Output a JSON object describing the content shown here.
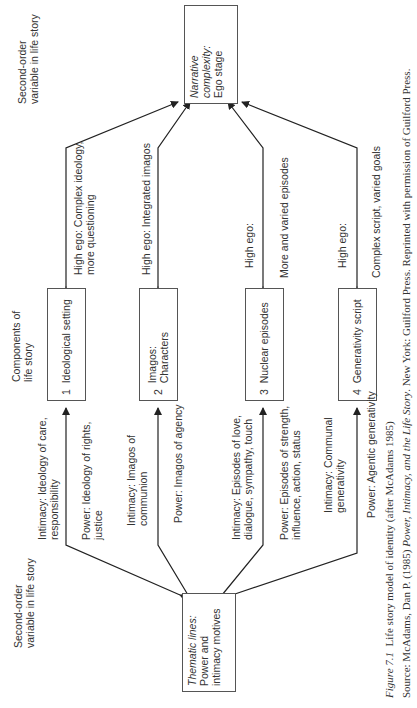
{
  "figure": {
    "caption_label": "Figure 7.1",
    "caption_text": "Life story model of identity (after McAdams 1985)",
    "source_prefix": "Source: McAdams, Dan P. (1985) ",
    "source_title": "Power, Intimacy, and the Life Story",
    "source_suffix": ". New York: Guilford Press. Reprinted with permission of Guilford Press."
  },
  "row_labels": {
    "top_second_order": "Second-order\nvariable in life story",
    "components": "Components of\nlife story",
    "bottom_second_order": "Second-order\nvariable in life story"
  },
  "narrative_box": {
    "line1": "Narrative",
    "line2": "complexity:",
    "line3": "Ego stage"
  },
  "thematic_box": {
    "line1": "Thematic lines:",
    "line2": "Power and",
    "line3": "intimacy motives"
  },
  "components": [
    {
      "number": "1",
      "label": "Ideological setting"
    },
    {
      "number": "2",
      "label": "Imagos:\nCharacters"
    },
    {
      "number": "3",
      "label": "Nuclear episodes"
    },
    {
      "number": "4",
      "label": "Generativity script"
    }
  ],
  "high_ego_labels": [
    "High ego: Complex ideology,\nmore questioning",
    "High ego: Integrated imagos",
    "High ego:",
    "More and varied episodes",
    "High ego:",
    "Complex script, varied goals"
  ],
  "thematic_labels": [
    "Intimacy: Ideology of care,\nresponsibility",
    "Power: Ideology of rights,\njustice",
    "Intimacy: Imagos of\ncommunion",
    "Power: Imagos of agency",
    "Intimacy: Episodes of love,\ndialogue, sympathy, touch",
    "Power: Episodes of strength,\ninfluence, action, status",
    "Intimacy: Communal\ngenerativity",
    "Power: Agentic generativity"
  ]
}
